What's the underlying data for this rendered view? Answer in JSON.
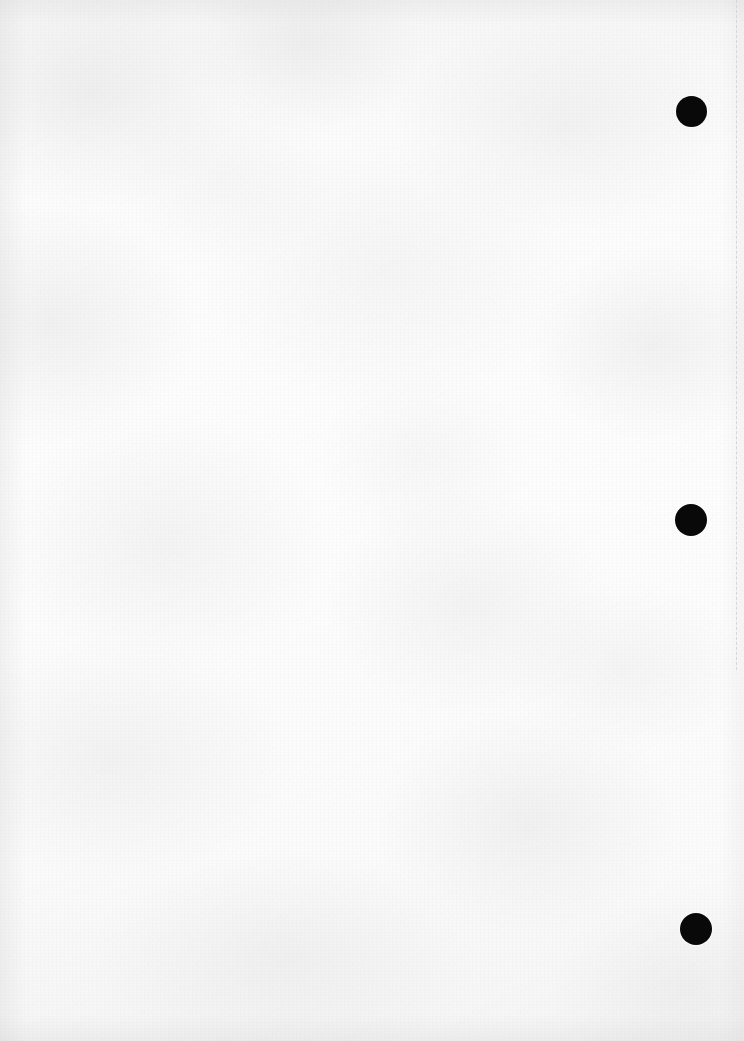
{
  "page": {
    "kind": "scanned-blank-document-page",
    "width": 744,
    "height": 1041,
    "paper_color": "#fbfbfb",
    "body_text": "",
    "caption": ""
  },
  "margin_rule": {
    "name": "right-margin-dashed-line",
    "color": "#d6d6d6",
    "x": 736,
    "y_start": 0,
    "y_end": 670,
    "dash": "4px 4px",
    "thickness": 1
  },
  "marks": {
    "color": "#090909",
    "shape": "circle",
    "items": [
      {
        "label": "mark-1",
        "x": 676,
        "y": 96,
        "size": 31
      },
      {
        "label": "mark-2",
        "x": 675,
        "y": 504,
        "size": 32
      },
      {
        "label": "mark-3",
        "x": 680,
        "y": 913,
        "size": 32
      }
    ]
  }
}
